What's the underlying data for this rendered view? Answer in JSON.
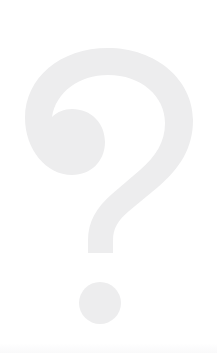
{
  "canvas": {
    "width": 217,
    "height": 353,
    "background_color": "#FFFFFF"
  },
  "placeholder": {
    "icon_name": "question-mark-icon",
    "glyph": "?",
    "alt_text": "?",
    "fill_color": "#EDEDEE",
    "parts": [
      {
        "name": "question-mark-bowl",
        "description": "hooked circular bowl of the question mark",
        "bounds": {
          "x": 25,
          "y": 48,
          "width": 168,
          "height": 127
        }
      },
      {
        "name": "question-mark-stem",
        "description": "descending curved stem ending in a flat vertical stub",
        "bounds": {
          "x": 88,
          "y": 140,
          "width": 60,
          "height": 113
        }
      },
      {
        "name": "question-mark-dot",
        "description": "round dot below the stem",
        "center_x": 100,
        "center_y": 303,
        "diameter": 42
      }
    ]
  },
  "artifacts": {
    "bottom_edge_band_color": "#F7F7F8"
  }
}
